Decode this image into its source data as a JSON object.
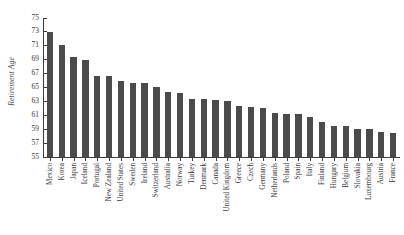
{
  "chart_data": {
    "type": "bar",
    "title": "",
    "xlabel": "",
    "ylabel": "Retirement Age",
    "ylim": [
      55,
      75
    ],
    "yticks": [
      55,
      57,
      59,
      61,
      63,
      65,
      67,
      69,
      71,
      73,
      75
    ],
    "grid": false,
    "legend": null,
    "bar_color": "#4b4b4b",
    "axis_color": "#3d3d3d",
    "categories": [
      "Mexico",
      "Korea",
      "Japan",
      "Iceland",
      "Portugal",
      "New Zealand",
      "United States",
      "Sweden",
      "Ireland",
      "Switzerland",
      "Australia",
      "Norway",
      "Turkey",
      "Denmark",
      "Canada",
      "United Kingdom",
      "Greece",
      "Czech",
      "Germany",
      "Netherlands",
      "Poland",
      "Spain",
      "Italy",
      "Finland",
      "Hungary",
      "Belgium",
      "Slovakia",
      "Luxembourg",
      "Austria",
      "France"
    ],
    "values": [
      73.0,
      71.1,
      69.4,
      68.9,
      66.6,
      66.6,
      66.0,
      65.7,
      65.6,
      65.1,
      64.4,
      64.2,
      63.4,
      63.4,
      63.2,
      63.1,
      62.4,
      62.2,
      62.1,
      61.4,
      61.2,
      61.2,
      60.7,
      60.0,
      59.5,
      59.5,
      59.1,
      59.0,
      58.6,
      58.5
    ]
  }
}
